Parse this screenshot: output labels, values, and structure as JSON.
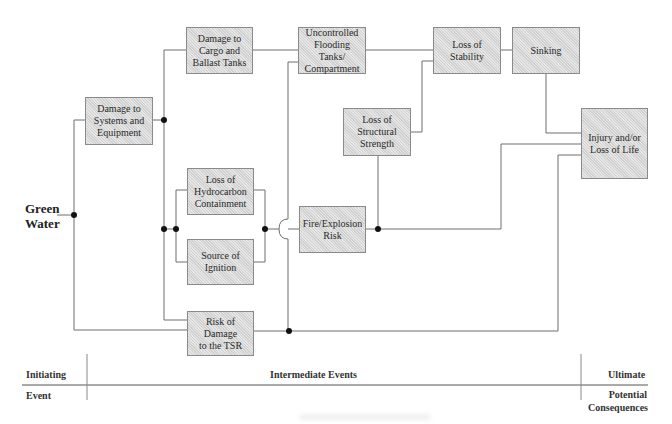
{
  "initiating_event": {
    "label_line1": "Green",
    "label_line2": "Water"
  },
  "boxes": {
    "systems": {
      "lines": [
        "Damage to",
        "Systems and",
        "Equipment"
      ]
    },
    "cargo": {
      "lines": [
        "Damage to",
        "Cargo and",
        "Ballast Tanks"
      ]
    },
    "flooding": {
      "lines": [
        "Uncontrolled",
        "Flooding",
        "Tanks/",
        "Compartment"
      ]
    },
    "stability": {
      "lines": [
        "Loss of",
        "Stability"
      ]
    },
    "sinking": {
      "lines": [
        "Sinking"
      ]
    },
    "structural": {
      "lines": [
        "Loss of",
        "Structural",
        "Strength"
      ]
    },
    "injury": {
      "lines": [
        "Injury and/or",
        "Loss of Life"
      ]
    },
    "hydrocarbon": {
      "lines": [
        "Loss of",
        "Hydrocarbon",
        "Containment"
      ]
    },
    "ignition": {
      "lines": [
        "Source of",
        "Ignition"
      ]
    },
    "fire": {
      "lines": [
        "Fire/Explosion",
        "Risk"
      ]
    },
    "tsr": {
      "lines": [
        "Risk of Damage",
        "to the TSR"
      ]
    }
  },
  "footer": {
    "initiating": "Initiating",
    "event": "Event",
    "intermediate": "Intermediate Events",
    "ultimate": "Ultimate",
    "potential": "Potential",
    "consequences": "Consequences"
  },
  "colors": {
    "box_fill": "#d9d9d9",
    "line": "#6e6e6e",
    "node": "#111111"
  }
}
